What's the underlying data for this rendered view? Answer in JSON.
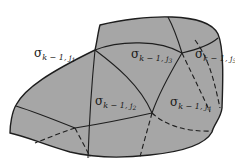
{
  "diagram": {
    "type": "subdivided-region",
    "colors": {
      "fill": "#a6a6a6",
      "stroke": "#1e1e1e",
      "text": "#1a1a1a",
      "background": "#ffffff"
    },
    "labels": [
      {
        "id": "j1",
        "symbol": "σ",
        "subscript": "k − 1, ",
        "index": "j",
        "index_sub": "1"
      },
      {
        "id": "j2",
        "symbol": "σ",
        "subscript": "k − 1, ",
        "index": "j",
        "index_sub": "2"
      },
      {
        "id": "j3",
        "symbol": "σ",
        "subscript": "k − 1, ",
        "index": "j",
        "index_sub": "3"
      },
      {
        "id": "j4",
        "symbol": "σ",
        "subscript": "k − 1, ",
        "index": "j",
        "index_sub": "4"
      },
      {
        "id": "j5",
        "symbol": "σ",
        "subscript": "k − 1, ",
        "index": "j",
        "index_sub": "5"
      }
    ]
  }
}
